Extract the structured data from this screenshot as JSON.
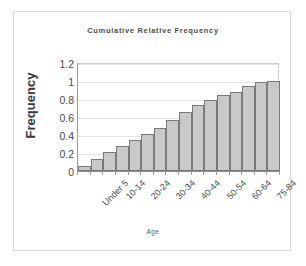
{
  "chart_data": {
    "type": "bar",
    "title": "Cumulative Relative Frequency",
    "xlabel": "Age",
    "ylabel": "Frequency",
    "ylim": [
      0,
      1.2
    ],
    "yticks": [
      "0",
      "0.2",
      "0.4",
      "0.6",
      "0.8",
      "1",
      "1.2"
    ],
    "ytick_values": [
      0,
      0.2,
      0.4,
      0.6,
      0.8,
      1,
      1.2
    ],
    "grid": true,
    "legend": false,
    "categories": [
      "Under 5",
      "5-9",
      "10-14",
      "15-19",
      "20-24",
      "25-29",
      "30-34",
      "35-39",
      "40-44",
      "45-49",
      "50-54",
      "55-59",
      "60-64",
      "65-74",
      "75-84",
      "85+"
    ],
    "visible_tick_labels": [
      "Under 5",
      "10-14",
      "20-24",
      "30-34",
      "40-44",
      "50-54",
      "60-64",
      "75-84"
    ],
    "visible_tick_indices": [
      0,
      2,
      4,
      6,
      8,
      10,
      12,
      14
    ],
    "values": [
      0.06,
      0.13,
      0.21,
      0.28,
      0.35,
      0.41,
      0.48,
      0.57,
      0.66,
      0.73,
      0.79,
      0.85,
      0.88,
      0.95,
      0.99,
      1.0
    ],
    "bar_fill_color": "#c9c9c9",
    "bar_border_color": "#7a7a7a",
    "gridline_color": "#e2e2e2",
    "axis_color": "#8c8c8c",
    "text_color": "#4a4a4a",
    "background_color": "#ffffff",
    "frame_color": "#d9d9d9"
  }
}
